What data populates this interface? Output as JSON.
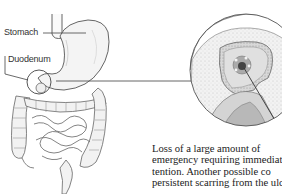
{
  "figure": {
    "labels": {
      "stomach": "Stomach",
      "duodenum": "Duodenum"
    },
    "inset": "magnified-ulcer-crater"
  },
  "text": {
    "lines": [
      "Loss of a large amount of",
      "emergency requiring immediat",
      "tention. Another possible co",
      "persistent scarring from the ulce"
    ]
  }
}
